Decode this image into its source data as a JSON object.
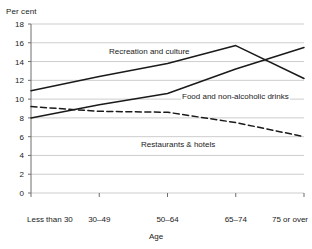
{
  "axis_unit_label": "Per cent",
  "x_axis_title": "Age",
  "labels": {
    "recreation": "Recreation and culture",
    "food": "Food and non-alcoholic drinks",
    "restaurants": "Restaurants & hotels"
  },
  "colors": {
    "line": "#1a1a1a",
    "grid": "#b8b8b8",
    "axis": "#6e6e6e",
    "background": "#ffffff"
  },
  "chart_data": {
    "type": "line",
    "title": "",
    "xlabel": "Age",
    "ylabel": "Per cent",
    "categories": [
      "Less than 30",
      "30–49",
      "50–64",
      "65–74",
      "75 or over"
    ],
    "ylim": [
      0,
      18
    ],
    "yticks": [
      0,
      2,
      4,
      6,
      8,
      10,
      12,
      14,
      16,
      18
    ],
    "grid": true,
    "legend": "inline-annotations",
    "series": [
      {
        "name": "Recreation and culture",
        "style": "solid",
        "values": [
          10.9,
          12.4,
          13.8,
          15.7,
          12.2
        ]
      },
      {
        "name": "Food and non-alcoholic drinks",
        "style": "solid",
        "values": [
          8.0,
          9.4,
          10.6,
          13.2,
          15.5
        ]
      },
      {
        "name": "Restaurants & hotels",
        "style": "dashed",
        "values": [
          9.2,
          8.7,
          8.6,
          7.5,
          6.0
        ]
      }
    ]
  }
}
